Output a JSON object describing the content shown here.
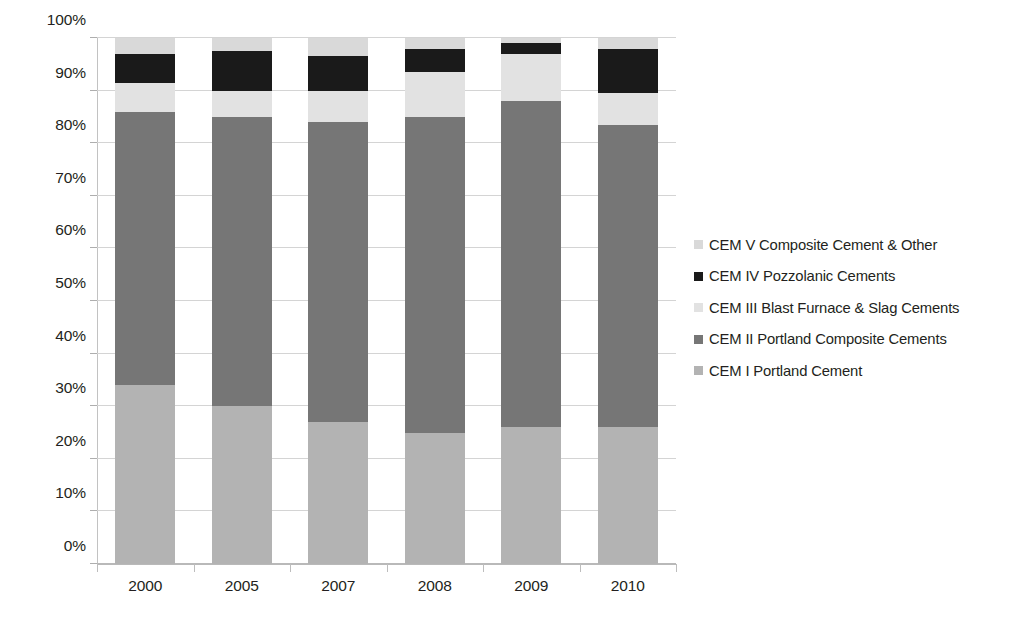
{
  "chart_data": {
    "type": "bar",
    "title": "",
    "subtitle": "",
    "xlabel": "",
    "ylabel": "",
    "stacked": true,
    "stack_mode": "percent",
    "grid": true,
    "legend_position": "right",
    "ylim": [
      0,
      100
    ],
    "ytick_labels": [
      "0%",
      "10%",
      "20%",
      "30%",
      "40%",
      "50%",
      "60%",
      "70%",
      "80%",
      "90%",
      "100%"
    ],
    "ytick_values": [
      0,
      10,
      20,
      30,
      40,
      50,
      60,
      70,
      80,
      90,
      100
    ],
    "categories": [
      "2000",
      "2005",
      "2007",
      "2008",
      "2009",
      "2010"
    ],
    "series": [
      {
        "name": "CEM I Portland Cement",
        "color": "#b3b3b3",
        "values": [
          34.0,
          30.0,
          27.0,
          25.0,
          26.0,
          26.0
        ]
      },
      {
        "name": "CEM II Portland Composite Cements",
        "color": "#767676",
        "values": [
          52.0,
          55.0,
          57.0,
          60.0,
          62.0,
          57.5
        ]
      },
      {
        "name": "CEM III Blast Furnace & Slag Cements",
        "color": "#e2e2e2",
        "values": [
          5.5,
          5.0,
          6.0,
          8.5,
          9.0,
          6.0
        ]
      },
      {
        "name": "CEM IV Pozzolanic Cements",
        "color": "#1a1a1a",
        "values": [
          5.5,
          7.5,
          6.5,
          4.5,
          2.0,
          8.5
        ]
      },
      {
        "name": "CEM V Composite Cement & Other",
        "color": "#d9d9d9",
        "values": [
          3.0,
          2.5,
          3.5,
          2.0,
          1.0,
          2.0
        ]
      }
    ],
    "legend_entries": [
      {
        "label": "CEM V Composite Cement & Other",
        "color": "#d9d9d9"
      },
      {
        "label": "CEM IV Pozzolanic Cements",
        "color": "#1a1a1a"
      },
      {
        "label": "CEM III Blast Furnace & Slag Cements",
        "color": "#e2e2e2"
      },
      {
        "label": "CEM II Portland Composite Cements",
        "color": "#767676"
      },
      {
        "label": "CEM I Portland Cement",
        "color": "#b3b3b3"
      }
    ]
  }
}
